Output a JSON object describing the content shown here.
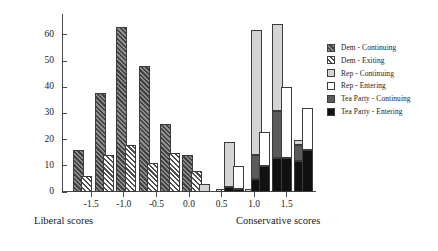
{
  "chart_data": {
    "type": "bar",
    "title": "",
    "xlabel_left": "Liberal scores",
    "xlabel_right": "Conservative scores",
    "ylabel": "",
    "ylim": [
      0,
      68
    ],
    "xlim": [
      -1.95,
      1.95
    ],
    "yticks": [
      0,
      10,
      20,
      30,
      40,
      50,
      60
    ],
    "xticks": [
      -1.5,
      -1.0,
      -0.5,
      0.0,
      0.5,
      1.0,
      1.5
    ],
    "xtick_labels": [
      "-1.5",
      "-1.0",
      "-0.5",
      "0.0",
      "0.5",
      "1.0",
      "1.5"
    ],
    "ytick_labels": [
      "0",
      "10",
      "20",
      "30",
      "40",
      "50",
      "60"
    ],
    "grid": false,
    "legend_position": "right",
    "stacked": true,
    "series": [
      {
        "name": "Dem - Continuing",
        "color": "#8e8e8e",
        "pattern": "hatch-dark"
      },
      {
        "name": "Dem - Exiting",
        "color": "#ffffff",
        "pattern": "hatch-light"
      },
      {
        "name": "Rep - Continuing",
        "color": "#d4d4d4",
        "pattern": "solid"
      },
      {
        "name": "Rep - Entering",
        "color": "#ffffff",
        "pattern": "solid"
      },
      {
        "name": "Tea Party - Continuing",
        "color": "#5a5a5a",
        "pattern": "solid"
      },
      {
        "name": "Tea Party - Entering",
        "color": "#111111",
        "pattern": "solid"
      }
    ],
    "bars": [
      {
        "x": -1.7,
        "series": "Dem - Continuing",
        "value": 16
      },
      {
        "x": -1.57,
        "series": "Dem - Exiting",
        "value": 6
      },
      {
        "x": -1.36,
        "series": "Dem - Continuing",
        "value": 38
      },
      {
        "x": -1.23,
        "series": "Dem - Exiting",
        "value": 14
      },
      {
        "x": -1.03,
        "series": "Dem - Continuing",
        "value": 63
      },
      {
        "x": -0.9,
        "series": "Dem - Exiting",
        "value": 18
      },
      {
        "x": -0.69,
        "series": "Dem - Continuing",
        "value": 48
      },
      {
        "x": -0.56,
        "series": "Dem - Exiting",
        "value": 11
      },
      {
        "x": -0.36,
        "series": "Dem - Continuing",
        "value": 26
      },
      {
        "x": -0.23,
        "series": "Dem - Exiting",
        "value": 15
      },
      {
        "x": -0.02,
        "series": "Dem - Continuing",
        "value": 14
      },
      {
        "x": 0.11,
        "series": "Dem - Exiting",
        "value": 8
      },
      {
        "x": 0.24,
        "series": "Rep - Continuing",
        "value": 3
      },
      {
        "x": 0.5,
        "series": "Rep - Continuing",
        "value": 1
      },
      {
        "x": 0.58,
        "series": "Rep - Entering",
        "value": 1
      },
      {
        "x": 0.63,
        "series": "Tea Party - Continuing",
        "value": 1
      },
      {
        "x": 0.7,
        "series": "Tea Party - Entering",
        "value": 1
      },
      {
        "x": 0.62,
        "series": "Rep - Continuing",
        "value": 19,
        "stack": [
          {
            "series": "Tea Party - Entering",
            "value": 2
          },
          {
            "series": "Rep - Continuing",
            "value": 17
          }
        ]
      },
      {
        "x": 0.76,
        "series": "Rep - Entering",
        "value": 10,
        "stack": [
          {
            "series": "Tea Party - Entering",
            "value": 1
          },
          {
            "series": "Rep - Entering",
            "value": 9
          }
        ]
      },
      {
        "x": 0.95,
        "series": "Rep - Continuing",
        "value": 1
      },
      {
        "x": 1.03,
        "series": "Rep - Continuing",
        "value": 62,
        "stack": [
          {
            "series": "Tea Party - Entering",
            "value": 5
          },
          {
            "series": "Tea Party - Continuing",
            "value": 9
          },
          {
            "series": "Rep - Continuing",
            "value": 48
          }
        ]
      },
      {
        "x": 1.16,
        "series": "Rep - Entering",
        "value": 23,
        "stack": [
          {
            "series": "Tea Party - Entering",
            "value": 10
          },
          {
            "series": "Rep - Entering",
            "value": 13
          }
        ]
      },
      {
        "x": 1.36,
        "series": "Rep - Continuing",
        "value": 64,
        "stack": [
          {
            "series": "Tea Party - Entering",
            "value": 13
          },
          {
            "series": "Tea Party - Continuing",
            "value": 18
          },
          {
            "series": "Rep - Continuing",
            "value": 33
          }
        ]
      },
      {
        "x": 1.49,
        "series": "Rep - Entering",
        "value": 40,
        "stack": [
          {
            "series": "Tea Party - Entering",
            "value": 13
          },
          {
            "series": "Rep - Entering",
            "value": 27
          }
        ]
      },
      {
        "x": 1.69,
        "series": "Rep - Continuing",
        "value": 20,
        "stack": [
          {
            "series": "Tea Party - Entering",
            "value": 12
          },
          {
            "series": "Tea Party - Continuing",
            "value": 6
          },
          {
            "series": "Rep - Continuing",
            "value": 2
          }
        ]
      },
      {
        "x": 1.82,
        "series": "Rep - Entering",
        "value": 32,
        "stack": [
          {
            "series": "Tea Party - Entering",
            "value": 16
          },
          {
            "series": "Rep - Entering",
            "value": 16
          }
        ]
      }
    ]
  },
  "legend": {
    "items": [
      {
        "label": "Dem - Continuing",
        "swatch": "p-demcont"
      },
      {
        "label": "Dem - Exiting",
        "swatch": "p-demexit"
      },
      {
        "label": "Rep - Continuing",
        "swatch": "p-repcont"
      },
      {
        "label": "Rep - Entering",
        "swatch": "p-repent"
      },
      {
        "label": "Tea Party - Continuing",
        "swatch": "p-teacont"
      },
      {
        "label": "Tea Party - Entering",
        "swatch": "p-teaent"
      }
    ]
  }
}
